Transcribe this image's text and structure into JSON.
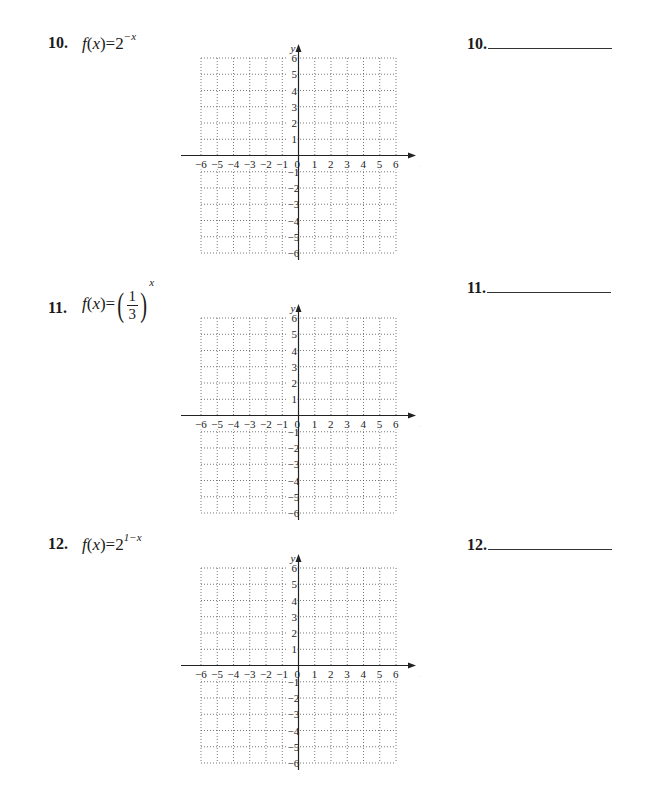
{
  "problems": [
    {
      "number": "10.",
      "function_text": "f(x)=2^(−x)",
      "func_prefix": "f",
      "func_arg": "x",
      "base": "2",
      "exponent": "−x",
      "answer_label": "10."
    },
    {
      "number": "11.",
      "function_text": "f(x)=(1/3)^x",
      "func_prefix": "f",
      "func_arg": "x",
      "frac_num": "1",
      "frac_den": "3",
      "exponent": "x",
      "answer_label": "11."
    },
    {
      "number": "12.",
      "function_text": "f(x)=2^(1−x)",
      "func_prefix": "f",
      "func_arg": "x",
      "base": "2",
      "exponent": "1−x",
      "answer_label": "12."
    }
  ],
  "grid": {
    "x_label": "x",
    "y_label": "y",
    "x_range": [
      -6,
      6
    ],
    "y_range": [
      -6,
      6
    ],
    "x_ticks": [
      "−6",
      "−5",
      "−4",
      "−3",
      "−2",
      "−1",
      "0",
      "1",
      "2",
      "3",
      "4",
      "5",
      "6"
    ],
    "y_ticks": [
      "6",
      "5",
      "4",
      "3",
      "2",
      "1",
      "−1",
      "−2",
      "−3",
      "−4",
      "−5",
      "−6"
    ],
    "grid_style": "dotted"
  },
  "chart_data": [
    {
      "type": "scatter",
      "title": "10. f(x)=2^(−x)",
      "xlabel": "x",
      "ylabel": "y",
      "xlim": [
        -6,
        6
      ],
      "ylim": [
        -6,
        6
      ],
      "grid": true,
      "series": []
    },
    {
      "type": "scatter",
      "title": "11. f(x)=(1/3)^x",
      "xlabel": "x",
      "ylabel": "y",
      "xlim": [
        -6,
        6
      ],
      "ylim": [
        -6,
        6
      ],
      "grid": true,
      "series": []
    },
    {
      "type": "scatter",
      "title": "12. f(x)=2^(1−x)",
      "xlabel": "x",
      "ylabel": "y",
      "xlim": [
        -6,
        6
      ],
      "ylim": [
        -6,
        6
      ],
      "grid": true,
      "series": []
    }
  ]
}
